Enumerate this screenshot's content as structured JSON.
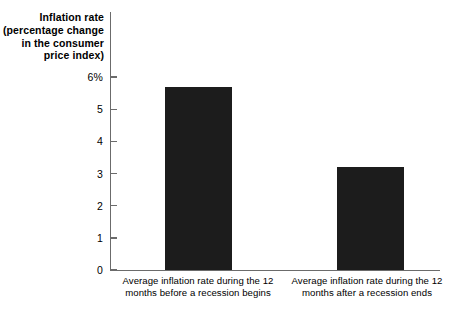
{
  "chart_data": {
    "type": "bar",
    "title": "",
    "ylabel": "Inflation rate (percentage change in the consumer price index)",
    "ylabel_lines": [
      "Inflation rate",
      "(percentage change",
      "in the consumer",
      "price index)"
    ],
    "xlabel": "",
    "categories": [
      "Average inflation rate during the 12 months before a recession begins",
      "Average inflation rate during the 12 months after a recession ends"
    ],
    "category_lines": [
      [
        "Average inflation rate during the 12",
        "months before a recession begins"
      ],
      [
        "Average inflation rate during the 12",
        "months after a recession ends"
      ]
    ],
    "values": [
      5.7,
      3.2
    ],
    "ylim": [
      0,
      6.2
    ],
    "yticks": [
      0,
      1,
      2,
      3,
      4,
      5,
      6
    ],
    "ytick_labels": [
      "0",
      "1",
      "2",
      "3",
      "4",
      "5",
      "6%"
    ],
    "grid": false,
    "legend": false,
    "bar_color": "#1c1c1c",
    "axis_color": "#6b6b6b",
    "background_color": "#ffffff"
  }
}
